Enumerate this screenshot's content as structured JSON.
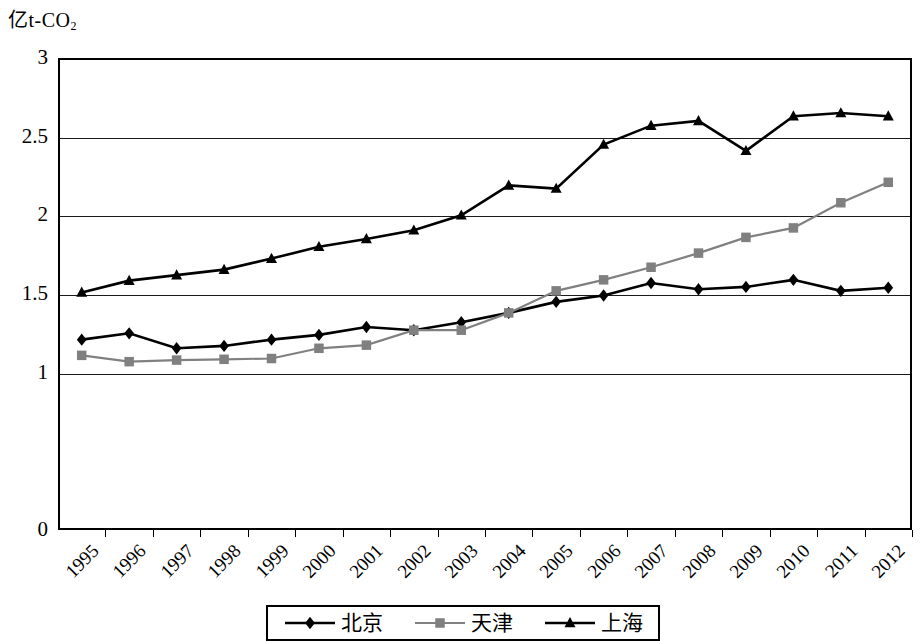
{
  "chart_data": {
    "type": "line",
    "title": "",
    "ylabel": "亿t-CO₂",
    "ylabel_main": "亿t-CO",
    "ylabel_sub": "2",
    "xlabel": "",
    "ylim": [
      0,
      3
    ],
    "yticks": [
      "0",
      "1",
      "1.5",
      "2",
      "2.5",
      "3"
    ],
    "ytick_values": [
      0,
      1,
      1.5,
      2,
      2.5,
      3
    ],
    "gridlines": [
      1,
      1.5,
      2,
      2.5
    ],
    "grid": true,
    "legend_position": "bottom",
    "categories": [
      "1995",
      "1996",
      "1997",
      "1998",
      "1999",
      "2000",
      "2001",
      "2002",
      "2003",
      "2004",
      "2005",
      "2006",
      "2007",
      "2008",
      "2009",
      "2010",
      "2011",
      "2012"
    ],
    "series": [
      {
        "name": "北京",
        "marker": "diamond",
        "color": "#000000",
        "values": [
          1.21,
          1.25,
          1.155,
          1.17,
          1.21,
          1.24,
          1.29,
          1.27,
          1.32,
          1.38,
          1.45,
          1.49,
          1.57,
          1.53,
          1.545,
          1.59,
          1.52,
          1.54
        ]
      },
      {
        "name": "天津",
        "marker": "square",
        "color": "#808080",
        "values": [
          1.11,
          1.07,
          1.08,
          1.085,
          1.09,
          1.155,
          1.175,
          1.27,
          1.27,
          1.38,
          1.52,
          1.59,
          1.67,
          1.76,
          1.86,
          1.92,
          2.08,
          2.21
        ]
      },
      {
        "name": "上海",
        "marker": "triangle",
        "color": "#000000",
        "values": [
          1.51,
          1.585,
          1.62,
          1.655,
          1.725,
          1.8,
          1.85,
          1.905,
          2.0,
          2.19,
          2.17,
          2.45,
          2.57,
          2.6,
          2.41,
          2.63,
          2.65,
          2.63
        ]
      }
    ]
  },
  "legend": {
    "items": [
      {
        "label": "北京",
        "marker": "diamond",
        "color": "#000000"
      },
      {
        "label": "天津",
        "marker": "square",
        "color": "#808080"
      },
      {
        "label": "上海",
        "marker": "triangle",
        "color": "#000000"
      }
    ]
  }
}
